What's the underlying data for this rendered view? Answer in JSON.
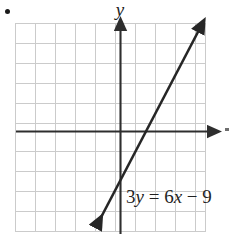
{
  "figure": {
    "bullet_marker": "•",
    "axis_label_y": "y",
    "equation_parts": {
      "lhs_coefficient": "3",
      "lhs_variable": "y",
      "equals": "=",
      "rhs_coefficient": "6",
      "rhs_variable": "x",
      "minus": "−",
      "constant": "9"
    },
    "equation_full": "3y = 6x − 9"
  },
  "chart_data": {
    "type": "line",
    "title": "",
    "subtitle": "",
    "xlabel": "",
    "ylabel": "y",
    "xlim": [
      -5.25,
      4.25
    ],
    "ylim": [
      -5.05,
      5.4
    ],
    "grid": true,
    "grid_spacing": 1,
    "grid_color": "#cccccc",
    "axis_color": "#333333",
    "legend": "none",
    "annotations": [
      {
        "text": "3y = 6x − 9",
        "x": 0.35,
        "y": -3.2
      }
    ],
    "xtick_labels": [],
    "ytick_labels": [],
    "series": [
      {
        "name": "3y = 6x − 9",
        "equation_slope_intercept": "y = 2x − 3",
        "slope": 2,
        "intercept": -3,
        "color": "#262626",
        "arrows": "both",
        "x": [
          -1.3,
          4.0
        ],
        "y": [
          -5.6,
          5.0
        ],
        "points": [
          {
            "label": "y-intercept",
            "x": 0,
            "y": -3
          },
          {
            "label": "x-intercept",
            "x": 1.5,
            "y": 0
          }
        ]
      }
    ]
  }
}
